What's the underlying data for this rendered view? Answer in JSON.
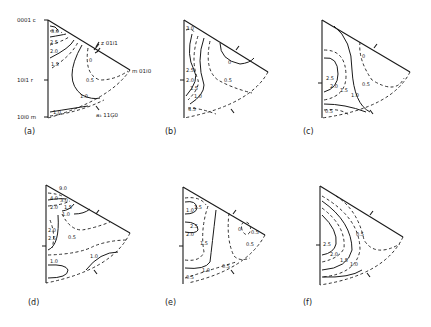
{
  "figure": {
    "panels": [
      {
        "id": "a",
        "caption": "(a)",
        "pole_labels": {
          "c": "0001 c",
          "r": "10ī1 r",
          "m": "10ī0 m",
          "z": "z 01ī1",
          "m2": "m 01ī0",
          "a": "a₃ 11Ģ0"
        },
        "contours": [
          "3.0",
          "2.5",
          "2.0",
          "1.5",
          "1.0",
          "0.5",
          "0",
          "1.0"
        ]
      },
      {
        "id": "b",
        "caption": "(b)",
        "contours": [
          "3.0",
          "2.5",
          "2.0",
          "1.5",
          "1.0",
          "0.5",
          "0",
          "4.5"
        ]
      },
      {
        "id": "c",
        "caption": "(c)",
        "contours": [
          "2.5",
          "2.0",
          "1.5",
          "1.0",
          "0.5",
          "0",
          "0.5"
        ]
      },
      {
        "id": "d",
        "caption": "(d)",
        "contours": [
          "9.0",
          "4.0",
          "3.0",
          "2.0",
          "1.5",
          "1.0",
          "0.5",
          "2.0",
          "2.5",
          "1.0",
          "1.0"
        ]
      },
      {
        "id": "e",
        "caption": "(e)",
        "contours": [
          "1.0",
          "1.5",
          "2.5",
          "2.0",
          "1.5",
          "1.0",
          "0.5",
          "0.5",
          "0",
          "0.5",
          "0.5"
        ]
      },
      {
        "id": "f",
        "caption": "(f)",
        "contours": [
          "2.5",
          "2.0",
          "1.5",
          "1.0",
          "0.5"
        ]
      }
    ]
  }
}
